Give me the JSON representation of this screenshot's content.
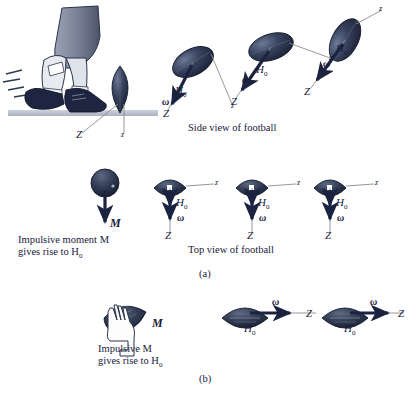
{
  "figure": {
    "title_a": "(a)",
    "title_b": "(b)",
    "caption_side": "Side view of football",
    "caption_top": "Top view of football",
    "caption_impulsive_moment_line1": "Impulsive moment M",
    "caption_impulsive_moment_line2": "gives rise to H",
    "caption_impulsive_line1": "Impulsive M",
    "caption_impulsive_line2": "gives rise to H",
    "subscript_zero": "0"
  },
  "symbols": {
    "Z_major": "Z",
    "z_minor": "z",
    "H": "H",
    "H_sub": "0",
    "omega": "ω",
    "M": "M"
  },
  "colors": {
    "ball_dark": "#202a45",
    "ball_mid": "#394766",
    "ball_light": "#6b7893",
    "ground": "#b9c0cc",
    "axis_line": "#8d8d8d",
    "arrow": "#1b2340",
    "pant": "#7f8a9e",
    "sock": "#e8eaee",
    "boot": "#1d2540",
    "text": "#18203a"
  },
  "panels": {
    "row_a_side": [
      {
        "name": "kick-impact-football",
        "labels": [
          "Z",
          "z"
        ]
      },
      {
        "name": "side-football-1",
        "labels": [
          "H",
          "0",
          "ω",
          "Z",
          "z"
        ]
      },
      {
        "name": "side-football-2",
        "labels": [
          "H",
          "0",
          "ω",
          "Z",
          "z"
        ]
      },
      {
        "name": "side-football-3",
        "labels": [
          "H",
          "0",
          "ω",
          "Z",
          "z"
        ]
      }
    ],
    "row_a_top": [
      {
        "name": "top-sphere-moment",
        "labels": [
          "M"
        ]
      },
      {
        "name": "top-football-1",
        "labels": [
          "H",
          "0",
          "ω",
          "Z",
          "z"
        ]
      },
      {
        "name": "top-football-2",
        "labels": [
          "H",
          "0",
          "ω",
          "Z",
          "z"
        ]
      },
      {
        "name": "top-football-3",
        "labels": [
          "H",
          "0",
          "ω",
          "Z",
          "z"
        ]
      }
    ],
    "row_b": [
      {
        "name": "hand-football",
        "labels": [
          "M"
        ]
      },
      {
        "name": "spiral-football-1",
        "labels": [
          "ω",
          "H",
          "0",
          "Z"
        ]
      },
      {
        "name": "spiral-football-2",
        "labels": [
          "ω",
          "H",
          "0",
          "Z"
        ]
      }
    ]
  }
}
